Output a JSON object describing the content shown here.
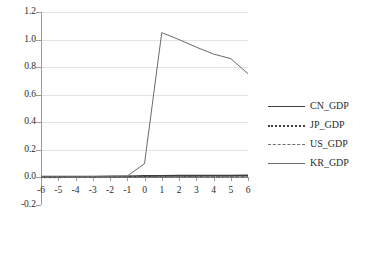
{
  "chart_data": {
    "type": "line",
    "title": "",
    "xlabel": "",
    "ylabel": "",
    "x": [
      -6,
      -5,
      -4,
      -3,
      -2,
      -1,
      0,
      1,
      2,
      3,
      4,
      5,
      6
    ],
    "xlim": [
      -6,
      6
    ],
    "ylim": [
      -0.2,
      1.2
    ],
    "ytick_labels": [
      "1.2",
      "1.0",
      "0.8",
      "0.6",
      "0.4",
      "0.2",
      "0.0",
      "-0.2"
    ],
    "ytick_values": [
      1.2,
      1.0,
      0.8,
      0.6,
      0.4,
      0.2,
      0.0,
      -0.2
    ],
    "xtick_labels": [
      "-6",
      "-5",
      "-4",
      "-3",
      "-2",
      "-1",
      "0",
      "1",
      "2",
      "3",
      "4",
      "5",
      "6"
    ],
    "grid": "horizontal",
    "legend_position": "right",
    "series": [
      {
        "name": "CN_GDP",
        "style": "solid-thick",
        "color": "#3f3f3f",
        "values": [
          0.005,
          0.005,
          0.006,
          0.006,
          0.007,
          0.008,
          0.01,
          0.011,
          0.012,
          0.012,
          0.013,
          0.013,
          0.014
        ]
      },
      {
        "name": "JP_GDP",
        "style": "dotted",
        "color": "#3f3f3f",
        "values": [
          0.002,
          0.002,
          0.003,
          0.003,
          0.004,
          0.004,
          0.005,
          0.006,
          0.006,
          0.007,
          0.007,
          0.008,
          0.008
        ]
      },
      {
        "name": "US_GDP",
        "style": "dashed",
        "color": "#6e6e6e",
        "values": [
          0.001,
          0.001,
          0.001,
          0.002,
          0.002,
          0.002,
          0.003,
          0.003,
          0.004,
          0.004,
          0.004,
          0.005,
          0.005
        ]
      },
      {
        "name": "KR_GDP",
        "style": "solid-thin",
        "color": "#6b6b6b",
        "values": [
          0.005,
          0.005,
          0.006,
          0.006,
          0.007,
          0.01,
          0.1,
          1.05,
          1.0,
          0.945,
          0.895,
          0.862,
          0.752
        ]
      }
    ]
  },
  "legend": {
    "items": [
      {
        "label": "CN_GDP",
        "swatch": "solid-thick"
      },
      {
        "label": "JP_GDP",
        "swatch": "dotted"
      },
      {
        "label": "US_GDP",
        "swatch": "dashed"
      },
      {
        "label": "KR_GDP",
        "swatch": "solid-thin"
      }
    ]
  }
}
